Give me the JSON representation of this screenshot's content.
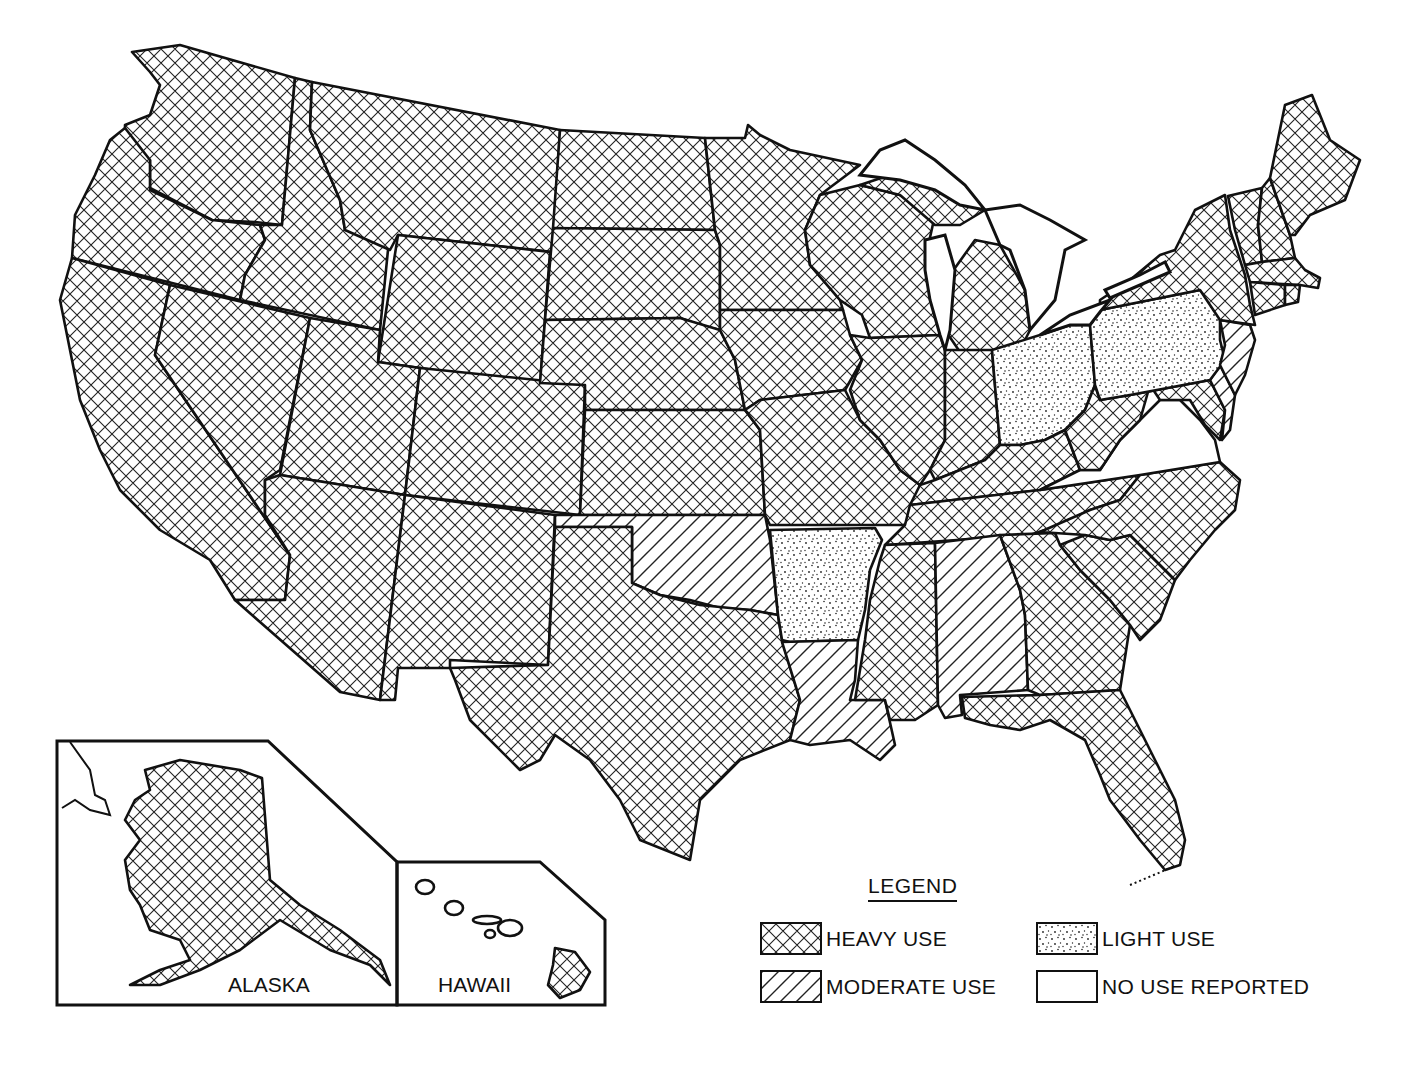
{
  "map": {
    "insets": {
      "alaska": {
        "label": "ALASKA",
        "category": "heavy"
      },
      "hawaii": {
        "label": "HAWAII",
        "category": "heavy_big_island_only"
      }
    }
  },
  "legend": {
    "title": "LEGEND",
    "items": [
      {
        "key": "heavy",
        "label": "HEAVY USE",
        "pattern": "crosshatch"
      },
      {
        "key": "light",
        "label": "LIGHT USE",
        "pattern": "dots"
      },
      {
        "key": "moderate",
        "label": "MODERATE USE",
        "pattern": "diagonal"
      },
      {
        "key": "none",
        "label": "NO USE REPORTED",
        "pattern": "blank"
      }
    ]
  },
  "states": {
    "heavy": [
      "WA",
      "OR",
      "CA",
      "ID",
      "NV",
      "MT",
      "WY",
      "UT",
      "AZ",
      "CO",
      "NM",
      "ND",
      "SD",
      "NE",
      "KS",
      "TX",
      "MN",
      "IA",
      "MO",
      "WI",
      "IL",
      "MI",
      "IN",
      "KY",
      "TN",
      "MS",
      "GA",
      "FL",
      "SC",
      "NC",
      "WV",
      "MD",
      "NY",
      "VT",
      "NH",
      "ME",
      "MA",
      "CT",
      "RI",
      "AK",
      "HI"
    ],
    "moderate": [
      "OK",
      "LA",
      "AL",
      "NJ",
      "DE"
    ],
    "light": [
      "AR",
      "OH",
      "PA"
    ],
    "none": [
      "VA"
    ]
  },
  "colors": {
    "ink": "#111111",
    "paper": "#ffffff"
  }
}
